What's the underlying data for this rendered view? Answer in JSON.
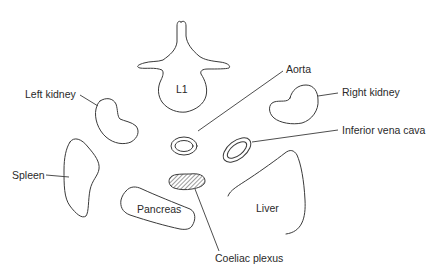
{
  "figure": {
    "type": "anatomical cross-section diagram",
    "structures": [
      {
        "id": "l1",
        "label": "L1"
      },
      {
        "id": "left-kidney",
        "label": "Left kidney"
      },
      {
        "id": "aorta",
        "label": "Aorta"
      },
      {
        "id": "right-kidney",
        "label": "Right kidney"
      },
      {
        "id": "ivc",
        "label": "Inferior vena cava"
      },
      {
        "id": "spleen",
        "label": "Spleen"
      },
      {
        "id": "pancreas",
        "label": "Pancreas"
      },
      {
        "id": "liver",
        "label": "Liver"
      },
      {
        "id": "coeliac-plexus",
        "label": "Coeliac plexus"
      }
    ]
  },
  "colors": {
    "stroke": "#3a3a3a",
    "text": "#2a2a2a",
    "background": "#ffffff"
  }
}
